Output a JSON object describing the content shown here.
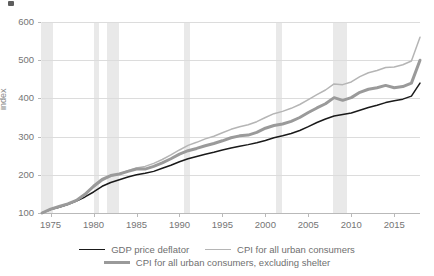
{
  "title_sliver": "",
  "chart_data": {
    "type": "line",
    "title": "",
    "xlabel": "",
    "ylabel": "index",
    "xlim": [
      1974,
      2018
    ],
    "ylim": [
      100,
      600
    ],
    "ytick_values": [
      100,
      200,
      300,
      400,
      500,
      600
    ],
    "ytick_labels": [
      "100",
      "200",
      "300",
      "400",
      "500",
      "600"
    ],
    "xtick_values": [
      1975,
      1980,
      1985,
      1990,
      1995,
      2000,
      2005,
      2010,
      2015
    ],
    "xtick_labels": [
      "1975",
      "1980",
      "1985",
      "1990",
      "1995",
      "2000",
      "2005",
      "2010",
      "2015"
    ],
    "grid": "horizontal",
    "legend_position": "bottom",
    "colors": {
      "gdp_price_deflator": "#1a1a1a",
      "cpi_all_urban": "#b5b5b5",
      "cpi_excluding_shelter": "#9a9a9a",
      "recession_band": "#e9e9e9",
      "gridline": "#dcdcdc",
      "axis": "#b9b9b9"
    },
    "recession_bands": [
      {
        "start": 1973.92,
        "end": 1975.25
      },
      {
        "start": 1980.08,
        "end": 1980.58
      },
      {
        "start": 1981.58,
        "end": 1982.92
      },
      {
        "start": 1990.58,
        "end": 1991.25
      },
      {
        "start": 2001.25,
        "end": 2001.92
      },
      {
        "start": 2007.92,
        "end": 2009.5
      }
    ],
    "x": [
      1974,
      1975,
      1976,
      1977,
      1978,
      1979,
      1980,
      1981,
      1982,
      1983,
      1984,
      1985,
      1986,
      1987,
      1988,
      1989,
      1990,
      1991,
      1992,
      1993,
      1994,
      1995,
      1996,
      1997,
      1998,
      1999,
      2000,
      2001,
      2002,
      2003,
      2004,
      2005,
      2006,
      2007,
      2008,
      2009,
      2010,
      2011,
      2012,
      2013,
      2014,
      2015,
      2016,
      2017,
      2018
    ],
    "series": [
      {
        "name": "GDP price deflator",
        "color": "#1a1a1a",
        "width": 1.5,
        "values": [
          100,
          109,
          115,
          122,
          131,
          142,
          155,
          170,
          180,
          187,
          194,
          200,
          204,
          209,
          217,
          225,
          234,
          242,
          248,
          254,
          259,
          265,
          270,
          275,
          279,
          284,
          290,
          297,
          302,
          308,
          316,
          326,
          337,
          346,
          354,
          358,
          362,
          369,
          376,
          382,
          389,
          394,
          398,
          406,
          440
        ]
      },
      {
        "name": "CPI for all urban consumers",
        "color": "#b5b5b5",
        "width": 1.5,
        "values": [
          100,
          109,
          116,
          123,
          132,
          147,
          167,
          184,
          196,
          202,
          211,
          218,
          222,
          230,
          240,
          252,
          265,
          277,
          285,
          294,
          301,
          310,
          319,
          326,
          331,
          339,
          350,
          360,
          366,
          374,
          384,
          397,
          410,
          422,
          438,
          436,
          443,
          457,
          467,
          473,
          481,
          482,
          488,
          498,
          560
        ]
      },
      {
        "name": "CPI for all urban consumers, excluding shelter",
        "color": "#9a9a9a",
        "width": 3,
        "values": [
          100,
          110,
          117,
          124,
          133,
          149,
          170,
          188,
          198,
          202,
          209,
          215,
          215,
          222,
          231,
          242,
          254,
          263,
          269,
          276,
          282,
          289,
          297,
          302,
          304,
          311,
          322,
          329,
          333,
          340,
          350,
          363,
          375,
          386,
          402,
          395,
          402,
          416,
          424,
          428,
          434,
          428,
          431,
          440,
          500
        ]
      }
    ]
  },
  "legend": {
    "items": [
      {
        "label": "GDP price deflator",
        "style": "deflator"
      },
      {
        "label": "CPI for all urban consumers",
        "style": "cpi"
      },
      {
        "label": "CPI for all urban consumers, excluding shelter",
        "style": "cpix"
      }
    ]
  }
}
